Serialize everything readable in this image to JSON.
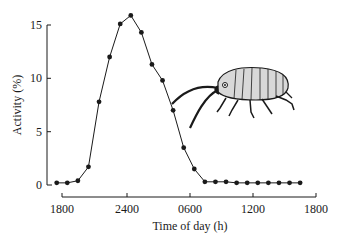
{
  "chart_data": {
    "type": "line",
    "title": "",
    "xlabel": "Time of day (h)",
    "ylabel": "Activity (%)",
    "x_tick_labels": [
      "1800",
      "2400",
      "0600",
      "1200",
      "1800"
    ],
    "y_tick_labels": [
      "0",
      "5",
      "10",
      "15"
    ],
    "ylim": [
      0,
      16
    ],
    "xlim_hours_from_1800": [
      -1,
      24.5
    ],
    "grid": false,
    "legend": null,
    "annotations": [
      "amphipod illustration (right side)"
    ],
    "series": [
      {
        "name": "Activity",
        "marker": "filled-circle",
        "x_hours_from_1800": [
          -0.5,
          0.5,
          1.5,
          2.5,
          3.5,
          4.5,
          5.5,
          6.5,
          7.5,
          8.5,
          9.5,
          10.5,
          11.5,
          12.5,
          13.5,
          14.5,
          15.5,
          16.5,
          17.5,
          18.5,
          19.5,
          20.5,
          21.5,
          22.5
        ],
        "values": [
          0.2,
          0.2,
          0.4,
          1.7,
          7.8,
          12.0,
          15.1,
          15.9,
          14.3,
          11.3,
          9.8,
          7.0,
          3.5,
          1.5,
          0.3,
          0.3,
          0.3,
          0.2,
          0.2,
          0.2,
          0.2,
          0.2,
          0.2,
          0.2
        ]
      }
    ]
  },
  "axes": {
    "x_title": "Time of day (h)",
    "y_title": "Activity (%)",
    "x_ticks": [
      "1800",
      "2400",
      "0600",
      "1200",
      "1800"
    ],
    "y_ticks": [
      "0",
      "5",
      "10",
      "15"
    ]
  },
  "colors": {
    "line": "#1a1a1a",
    "background": "#ffffff"
  }
}
